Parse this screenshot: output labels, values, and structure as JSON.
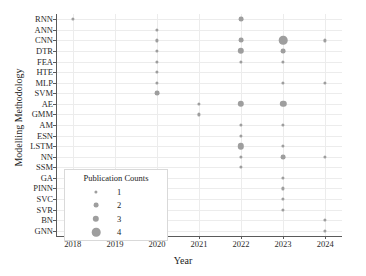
{
  "chart_data": {
    "type": "scatter",
    "title": "",
    "xlabel": "Year",
    "ylabel": "Modelling Methodology",
    "grid": true,
    "legend_position": "inside-bottom-left",
    "size_legend_title": "Publication Counts",
    "size_legend_values": [
      1,
      2,
      3,
      4
    ],
    "x_ticks": [
      "2018",
      "2019",
      "2020",
      "2021",
      "2022",
      "2023",
      "2024"
    ],
    "xlim": [
      2017.6,
      2024.4
    ],
    "categories": [
      "RNN",
      "ANN",
      "CNN",
      "DTR",
      "FEA",
      "HTE",
      "MLP",
      "SVM",
      "AE",
      "GMM",
      "AM",
      "ESN",
      "LSTM",
      "NN",
      "SSM",
      "GA",
      "PINN",
      "SVC",
      "SVR",
      "BN",
      "GNN"
    ],
    "point_color": "#9e9e9e",
    "points": [
      {
        "year": 2018,
        "method": "RNN",
        "count": 1
      },
      {
        "year": 2020,
        "method": "ANN",
        "count": 1
      },
      {
        "year": 2020,
        "method": "CNN",
        "count": 1
      },
      {
        "year": 2020,
        "method": "DTR",
        "count": 1
      },
      {
        "year": 2020,
        "method": "FEA",
        "count": 1
      },
      {
        "year": 2020,
        "method": "HTE",
        "count": 1
      },
      {
        "year": 2020,
        "method": "MLP",
        "count": 1
      },
      {
        "year": 2020,
        "method": "SVM",
        "count": 2
      },
      {
        "year": 2021,
        "method": "AE",
        "count": 1
      },
      {
        "year": 2021,
        "method": "GMM",
        "count": 1
      },
      {
        "year": 2022,
        "method": "RNN",
        "count": 2
      },
      {
        "year": 2022,
        "method": "CNN",
        "count": 2
      },
      {
        "year": 2022,
        "method": "DTR",
        "count": 3
      },
      {
        "year": 2022,
        "method": "FEA",
        "count": 1
      },
      {
        "year": 2022,
        "method": "AE",
        "count": 3
      },
      {
        "year": 2022,
        "method": "AM",
        "count": 1
      },
      {
        "year": 2022,
        "method": "ESN",
        "count": 1
      },
      {
        "year": 2022,
        "method": "LSTM",
        "count": 3
      },
      {
        "year": 2022,
        "method": "NN",
        "count": 1
      },
      {
        "year": 2022,
        "method": "SSM",
        "count": 1
      },
      {
        "year": 2023,
        "method": "CNN",
        "count": 4
      },
      {
        "year": 2023,
        "method": "DTR",
        "count": 2
      },
      {
        "year": 2023,
        "method": "FEA",
        "count": 1
      },
      {
        "year": 2023,
        "method": "MLP",
        "count": 1
      },
      {
        "year": 2023,
        "method": "AE",
        "count": 3
      },
      {
        "year": 2023,
        "method": "AM",
        "count": 1
      },
      {
        "year": 2023,
        "method": "LSTM",
        "count": 1
      },
      {
        "year": 2023,
        "method": "NN",
        "count": 2
      },
      {
        "year": 2023,
        "method": "GA",
        "count": 1
      },
      {
        "year": 2023,
        "method": "PINN",
        "count": 1
      },
      {
        "year": 2023,
        "method": "SVC",
        "count": 1
      },
      {
        "year": 2023,
        "method": "SVR",
        "count": 1
      },
      {
        "year": 2024,
        "method": "CNN",
        "count": 1
      },
      {
        "year": 2024,
        "method": "MLP",
        "count": 1
      },
      {
        "year": 2024,
        "method": "NN",
        "count": 1
      },
      {
        "year": 2024,
        "method": "BN",
        "count": 1
      },
      {
        "year": 2024,
        "method": "GNN",
        "count": 1
      }
    ]
  }
}
